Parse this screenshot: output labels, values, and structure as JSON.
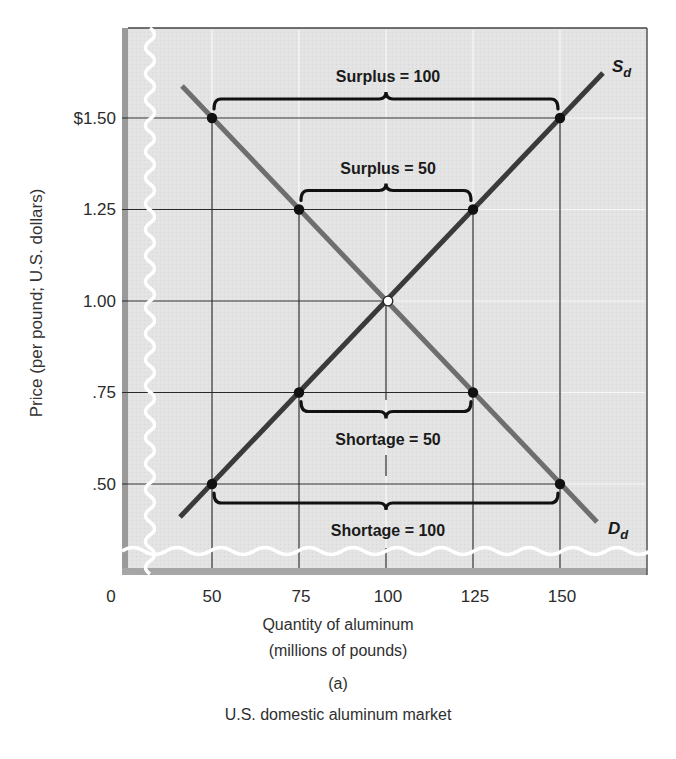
{
  "chart_data": {
    "type": "line",
    "title": "U.S. domestic aluminum market",
    "panel_label": "(a)",
    "xlabel": "Quantity of aluminum (millions of pounds)",
    "xlabel_line1": "Quantity of aluminum",
    "xlabel_line2": "(millions of pounds)",
    "ylabel": "Price (per pound; U.S. dollars)",
    "x_ticks": [
      "0",
      "50",
      "75",
      "100",
      "125",
      "150"
    ],
    "y_ticks": [
      "$1.50",
      "1.25",
      "1.00",
      ".75",
      ".50"
    ],
    "x_tick_values": [
      0,
      50,
      75,
      100,
      125,
      150
    ],
    "y_tick_values": [
      1.5,
      1.25,
      1.0,
      0.75,
      0.5
    ],
    "xlim": [
      0,
      170
    ],
    "ylim": [
      0.3,
      1.7
    ],
    "axis_breaks": [
      "x",
      "y"
    ],
    "grid": true,
    "series": [
      {
        "name": "S_d",
        "label": "S",
        "subscript": "d",
        "kind": "supply",
        "color": "#3a3a3a",
        "points": [
          [
            50,
            0.5
          ],
          [
            75,
            0.75
          ],
          [
            100,
            1.0
          ],
          [
            125,
            1.25
          ],
          [
            150,
            1.5
          ]
        ]
      },
      {
        "name": "D_d",
        "label": "D",
        "subscript": "d",
        "kind": "demand",
        "color": "#6e6e6e",
        "points": [
          [
            50,
            1.5
          ],
          [
            75,
            1.25
          ],
          [
            100,
            1.0
          ],
          [
            125,
            0.75
          ],
          [
            150,
            0.5
          ]
        ]
      }
    ],
    "equilibrium": {
      "x": 100,
      "y": 1.0
    },
    "annotations": [
      {
        "text": "Surplus = 100",
        "price": 1.5,
        "from": 50,
        "to": 150,
        "position": "above"
      },
      {
        "text": "Surplus = 50",
        "price": 1.25,
        "from": 75,
        "to": 125,
        "position": "above"
      },
      {
        "text": "Shortage = 50",
        "price": 0.75,
        "from": 75,
        "to": 125,
        "position": "below"
      },
      {
        "text": "Shortage = 100",
        "price": 0.5,
        "from": 50,
        "to": 150,
        "position": "below"
      }
    ]
  },
  "colors": {
    "plot_bg": "#e4e4e4",
    "frame": "#555555",
    "grid_white": "#f7f7f7",
    "ref_lines": "#2a2a2a",
    "supply": "#3a3a3a",
    "demand": "#6e6e6e",
    "break": "#ffffff"
  }
}
